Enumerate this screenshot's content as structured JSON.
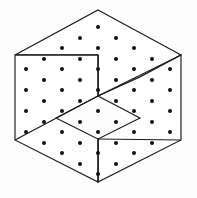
{
  "figure": {
    "caption": "",
    "canvas": {
      "width": 197,
      "height": 198
    },
    "background_color": "#fdfdfd",
    "line_color": "#1a1a1a",
    "fill_color": "#ffffff",
    "dot_color": "#111111",
    "line_width": 1.15,
    "dot_radius": 2.0,
    "symmetry": "3-fold rotational pinwheel",
    "piece_count": 3,
    "dot_count": 37,
    "outline": {
      "shape": "hexagon",
      "vertices": [
        [
          98,
          10
        ],
        [
          181,
          55
        ],
        [
          181,
          140
        ],
        [
          98,
          182
        ],
        [
          15,
          140
        ],
        [
          15,
          55
        ]
      ]
    },
    "center": [
      98,
      96
    ],
    "pieces": [
      {
        "name": "piece-top",
        "label": "top-piece",
        "points": [
          [
            98,
            10
          ],
          [
            181,
            55
          ],
          [
            140,
            77
          ],
          [
            98,
            96
          ],
          [
            98,
            55
          ],
          [
            15,
            55
          ]
        ]
      },
      {
        "name": "piece-lower-right",
        "label": "lower-right-piece",
        "points": [
          [
            181,
            55
          ],
          [
            181,
            140
          ],
          [
            98,
            182
          ],
          [
            98,
            139
          ],
          [
            140,
            118
          ],
          [
            98,
            96
          ],
          [
            140,
            77
          ]
        ]
      },
      {
        "name": "piece-lower-left",
        "label": "lower-left-piece",
        "points": [
          [
            15,
            55
          ],
          [
            98,
            55
          ],
          [
            98,
            96
          ],
          [
            56,
            118
          ],
          [
            98,
            139
          ],
          [
            98,
            182
          ],
          [
            15,
            140
          ]
        ]
      }
    ],
    "cut_lines": [
      {
        "name": "cut-center-to-upper-right",
        "from": [
          98,
          96
        ],
        "to": [
          181,
          55
        ]
      },
      {
        "name": "cut-center-vertical-up",
        "from": [
          98,
          96
        ],
        "to": [
          98,
          55
        ]
      },
      {
        "name": "cut-center-horizontal-left",
        "from": [
          98,
          55
        ],
        "to": [
          15,
          55
        ]
      },
      {
        "name": "cut-center-to-lower-left",
        "from": [
          98,
          96
        ],
        "to": [
          15,
          140
        ]
      },
      {
        "name": "cut-center-vertical-down",
        "from": [
          98,
          139
        ],
        "to": [
          98,
          182
        ]
      },
      {
        "name": "cut-center-to-lower-right",
        "from": [
          98,
          139
        ],
        "to": [
          181,
          140
        ]
      }
    ],
    "dots": [
      [
        98,
        27
      ],
      [
        80,
        38
      ],
      [
        116,
        38
      ],
      [
        62,
        48
      ],
      [
        98,
        48
      ],
      [
        134,
        48
      ],
      [
        44,
        59
      ],
      [
        80,
        59
      ],
      [
        116,
        59
      ],
      [
        152,
        59
      ],
      [
        26,
        69
      ],
      [
        62,
        69
      ],
      [
        98,
        69
      ],
      [
        134,
        69
      ],
      [
        170,
        69
      ],
      [
        44,
        80
      ],
      [
        80,
        80
      ],
      [
        116,
        80
      ],
      [
        152,
        80
      ],
      [
        26,
        90
      ],
      [
        62,
        90
      ],
      [
        98,
        90
      ],
      [
        134,
        90
      ],
      [
        170,
        90
      ],
      [
        44,
        101
      ],
      [
        80,
        101
      ],
      [
        116,
        101
      ],
      [
        152,
        101
      ],
      [
        26,
        111
      ],
      [
        62,
        111
      ],
      [
        98,
        111
      ],
      [
        134,
        111
      ],
      [
        170,
        111
      ],
      [
        44,
        122
      ],
      [
        80,
        122
      ],
      [
        116,
        122
      ],
      [
        152,
        122
      ],
      [
        26,
        132
      ],
      [
        62,
        132
      ],
      [
        98,
        132
      ],
      [
        134,
        132
      ],
      [
        170,
        132
      ],
      [
        44,
        143
      ],
      [
        80,
        143
      ],
      [
        116,
        143
      ],
      [
        152,
        143
      ],
      [
        62,
        153
      ],
      [
        98,
        153
      ],
      [
        134,
        153
      ],
      [
        80,
        164
      ],
      [
        116,
        164
      ],
      [
        98,
        174
      ]
    ]
  }
}
